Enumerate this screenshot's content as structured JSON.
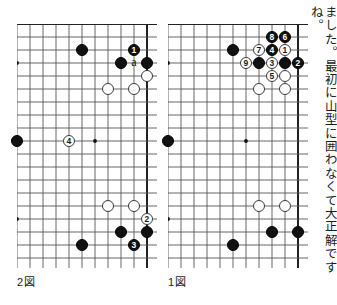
{
  "page": {
    "width": 334,
    "height": 305,
    "background": "#ffffff",
    "ink_color": "#111111",
    "line_color": "#555555"
  },
  "commentary": {
    "text": "ました。最初に山型に囲わなくて大正解ですね。"
  },
  "figures": [
    {
      "id": "figure-2",
      "label": "2図",
      "label_x": 17,
      "label_y": 273,
      "board": {
        "x": 17,
        "y": 24,
        "cols": 11,
        "rows": 19,
        "cell": 13.0,
        "edges": {
          "top": true,
          "right": true,
          "left": false,
          "bottom": false
        },
        "star_points": [
          {
            "col": 0,
            "row": 3
          },
          {
            "col": 0,
            "row": 9
          },
          {
            "col": 0,
            "row": 15
          },
          {
            "col": 6,
            "row": 9
          }
        ],
        "stones": [
          {
            "col": 5,
            "row": 2,
            "color": "black",
            "label": ""
          },
          {
            "col": 9,
            "row": 2,
            "color": "black",
            "label": "1"
          },
          {
            "col": 8,
            "row": 3,
            "color": "black",
            "label": ""
          },
          {
            "col": 10,
            "row": 3,
            "color": "black",
            "label": ""
          },
          {
            "col": 10,
            "row": 4,
            "color": "white",
            "label": ""
          },
          {
            "col": 7,
            "row": 5,
            "color": "white",
            "label": ""
          },
          {
            "col": 9,
            "row": 5,
            "color": "white",
            "label": ""
          },
          {
            "col": 0,
            "row": 9,
            "color": "black",
            "label": ""
          },
          {
            "col": 4,
            "row": 9,
            "color": "white",
            "label": "4"
          },
          {
            "col": 7,
            "row": 14,
            "color": "white",
            "label": ""
          },
          {
            "col": 9,
            "row": 14,
            "color": "white",
            "label": ""
          },
          {
            "col": 10,
            "row": 15,
            "color": "white",
            "label": "2"
          },
          {
            "col": 8,
            "row": 16,
            "color": "black",
            "label": ""
          },
          {
            "col": 10,
            "row": 16,
            "color": "black",
            "label": ""
          },
          {
            "col": 9,
            "row": 17,
            "color": "black",
            "label": "3"
          },
          {
            "col": 5,
            "row": 17,
            "color": "black",
            "label": ""
          }
        ],
        "letter_markers": [
          {
            "col": 9,
            "row": 3,
            "text": "a"
          }
        ]
      }
    },
    {
      "id": "figure-1",
      "label": "1図",
      "label_x": 168,
      "label_y": 273,
      "board": {
        "x": 168,
        "y": 24,
        "cols": 11,
        "rows": 19,
        "cell": 13.0,
        "edges": {
          "top": true,
          "right": true,
          "left": false,
          "bottom": false
        },
        "star_points": [
          {
            "col": 0,
            "row": 3
          },
          {
            "col": 0,
            "row": 9
          },
          {
            "col": 0,
            "row": 15
          },
          {
            "col": 6,
            "row": 9
          }
        ],
        "stones": [
          {
            "col": 8,
            "row": 1,
            "color": "black",
            "label": "8"
          },
          {
            "col": 9,
            "row": 1,
            "color": "black",
            "label": "6"
          },
          {
            "col": 5,
            "row": 2,
            "color": "black",
            "label": ""
          },
          {
            "col": 7,
            "row": 2,
            "color": "white",
            "label": "7"
          },
          {
            "col": 8,
            "row": 2,
            "color": "black",
            "label": "4"
          },
          {
            "col": 9,
            "row": 2,
            "color": "white",
            "label": "1"
          },
          {
            "col": 6,
            "row": 3,
            "color": "white",
            "label": "9"
          },
          {
            "col": 7,
            "row": 3,
            "color": "black",
            "label": ""
          },
          {
            "col": 8,
            "row": 3,
            "color": "white",
            "label": "3"
          },
          {
            "col": 9,
            "row": 3,
            "color": "black",
            "label": ""
          },
          {
            "col": 10,
            "row": 3,
            "color": "black",
            "label": "2"
          },
          {
            "col": 8,
            "row": 4,
            "color": "white",
            "label": "5"
          },
          {
            "col": 9,
            "row": 4,
            "color": "white",
            "label": ""
          },
          {
            "col": 7,
            "row": 5,
            "color": "white",
            "label": ""
          },
          {
            "col": 9,
            "row": 5,
            "color": "white",
            "label": ""
          },
          {
            "col": 0,
            "row": 9,
            "color": "black",
            "label": ""
          },
          {
            "col": 7,
            "row": 14,
            "color": "white",
            "label": ""
          },
          {
            "col": 9,
            "row": 14,
            "color": "white",
            "label": ""
          },
          {
            "col": 8,
            "row": 16,
            "color": "black",
            "label": ""
          },
          {
            "col": 10,
            "row": 16,
            "color": "black",
            "label": ""
          },
          {
            "col": 5,
            "row": 17,
            "color": "black",
            "label": ""
          }
        ],
        "letter_markers": []
      }
    }
  ]
}
